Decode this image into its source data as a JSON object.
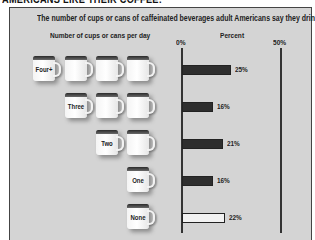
{
  "headline": "AMERICANS LIKE THEIR COFFEE:",
  "chart_data": {
    "type": "bar",
    "orientation": "horizontal",
    "title": "The number of cups or cans of caffeinated beverages adult Americans say they drink daily:",
    "category_axis_label": "Number of cups or cans per day",
    "value_axis_label": "Percent",
    "categories": [
      "Four+",
      "Three",
      "Two",
      "One",
      "None"
    ],
    "values": [
      25,
      16,
      21,
      16,
      22
    ],
    "value_labels": [
      "25%",
      "16%",
      "21%",
      "16%",
      "22%"
    ],
    "mug_counts": [
      4,
      3,
      2,
      1,
      1
    ],
    "xlim": [
      0,
      50
    ],
    "tick_labels": [
      "0%",
      "50%"
    ],
    "grid": false,
    "legend": null,
    "colors": {
      "bar_fill": "#2e2e2e",
      "bar_fill_none": "#f2f2f2",
      "panel_bg": "#d4d4d4"
    }
  },
  "rows": [
    {
      "label": "Four+",
      "pct": "25%",
      "value": 25,
      "mugs": 4,
      "top": 48,
      "fill": "#2e2e2e"
    },
    {
      "label": "Three",
      "pct": "16%",
      "value": 16,
      "mugs": 3,
      "top": 85,
      "fill": "#2e2e2e"
    },
    {
      "label": "Two",
      "pct": "21%",
      "value": 21,
      "mugs": 2,
      "top": 122,
      "fill": "#2e2e2e"
    },
    {
      "label": "One",
      "pct": "16%",
      "value": 16,
      "mugs": 1,
      "top": 159,
      "fill": "#2e2e2e"
    },
    {
      "label": "None",
      "pct": "22%",
      "value": 22,
      "mugs": 1,
      "top": 196,
      "fill": "#f2f2f2"
    }
  ]
}
